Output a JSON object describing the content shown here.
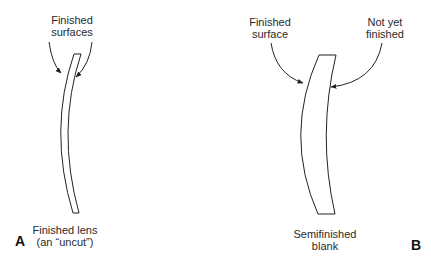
{
  "figure": {
    "panel_a": {
      "letter": "A",
      "callout_line1": "Finished",
      "callout_line2": "surfaces",
      "caption_line1": "Finished lens",
      "caption_line2": "(an “uncut”)"
    },
    "panel_b": {
      "letter": "B",
      "callout_left_line1": "Finished",
      "callout_left_line2": "surface",
      "callout_right_line1": "Not yet",
      "callout_right_line2": "finished",
      "caption_line1": "Semifinished",
      "caption_line2": "blank"
    },
    "colors": {
      "stroke": "#222222",
      "background": "#ffffff"
    }
  }
}
